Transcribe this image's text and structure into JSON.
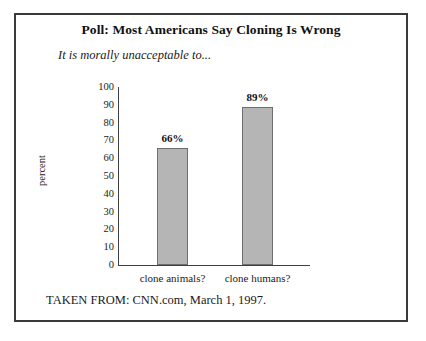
{
  "figure": {
    "title": "Poll: Most Americans Say Cloning Is Wrong",
    "subtitle": "It is morally unacceptable to...",
    "source": "TAKEN FROM: CNN.com, March 1, 1997."
  },
  "chart_data": {
    "type": "bar",
    "title": "Poll: Most Americans Say Cloning Is Wrong",
    "subtitle": "It is morally unacceptable to...",
    "categories": [
      "clone animals?",
      "clone humans?"
    ],
    "values": [
      66,
      89
    ],
    "value_labels": [
      "66%",
      "89%"
    ],
    "xlabel": "",
    "ylabel": "percent",
    "ylim": [
      0,
      100
    ],
    "ytick_step": 10,
    "yticks": [
      100,
      90,
      80,
      70,
      60,
      50,
      40,
      30,
      20,
      10,
      0
    ],
    "ytick_labels": [
      "100",
      "90",
      "80",
      "70",
      "60",
      "50",
      "40",
      "30",
      "20",
      "10",
      "0"
    ],
    "grid": false,
    "legend": "none",
    "bar_fill_color": "#b5b5b5",
    "bar_edge_color": "#6e6e6e",
    "axis_color": "#3f3f3f",
    "source": "TAKEN FROM: CNN.com, March 1, 1997."
  }
}
